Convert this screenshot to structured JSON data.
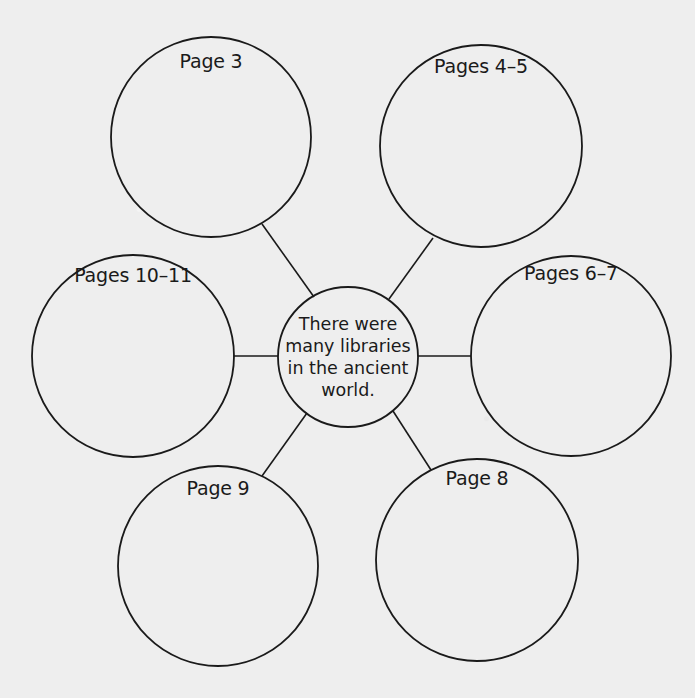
{
  "diagram": {
    "type": "concept-web",
    "center": {
      "lines": [
        "There were",
        "many libraries",
        "in the ancient",
        "world."
      ],
      "cx": 348,
      "cy": 357,
      "r": 70
    },
    "nodes": [
      {
        "label": "Page 3",
        "cx": 211,
        "cy": 137,
        "r": 100,
        "label_x": 211,
        "label_y": 50
      },
      {
        "label": "Pages 4–5",
        "cx": 481,
        "cy": 146,
        "r": 101,
        "label_x": 481,
        "label_y": 55
      },
      {
        "label": "Pages 6–7",
        "cx": 571,
        "cy": 356,
        "r": 100,
        "label_x": 571,
        "label_y": 262
      },
      {
        "label": "Page 8",
        "cx": 477,
        "cy": 560,
        "r": 101,
        "label_x": 477,
        "label_y": 467
      },
      {
        "label": "Page 9",
        "cx": 218,
        "cy": 566,
        "r": 100,
        "label_x": 218,
        "label_y": 477
      },
      {
        "label": "Pages 10–11",
        "cx": 133,
        "cy": 356,
        "r": 101,
        "label_x": 133,
        "label_y": 264
      }
    ],
    "spokes": [
      {
        "to": "Page 3",
        "x1": 314,
        "y1": 297,
        "x2": 262,
        "y2": 224
      },
      {
        "to": "Pages 4–5",
        "x1": 389,
        "y1": 299,
        "x2": 433,
        "y2": 238
      },
      {
        "to": "Pages 6–7",
        "x1": 418,
        "y1": 356,
        "x2": 471,
        "y2": 356
      },
      {
        "to": "Page 8",
        "x1": 393,
        "y1": 411,
        "x2": 431,
        "y2": 470
      },
      {
        "to": "Page 9",
        "x1": 307,
        "y1": 413,
        "x2": 262,
        "y2": 476
      },
      {
        "to": "Pages 10–11",
        "x1": 278,
        "y1": 356,
        "x2": 233,
        "y2": 356
      }
    ],
    "colors": {
      "paper": "#eeeeee",
      "ink": "#1a1a1a",
      "bleed_through": "#cfcfcf"
    }
  }
}
